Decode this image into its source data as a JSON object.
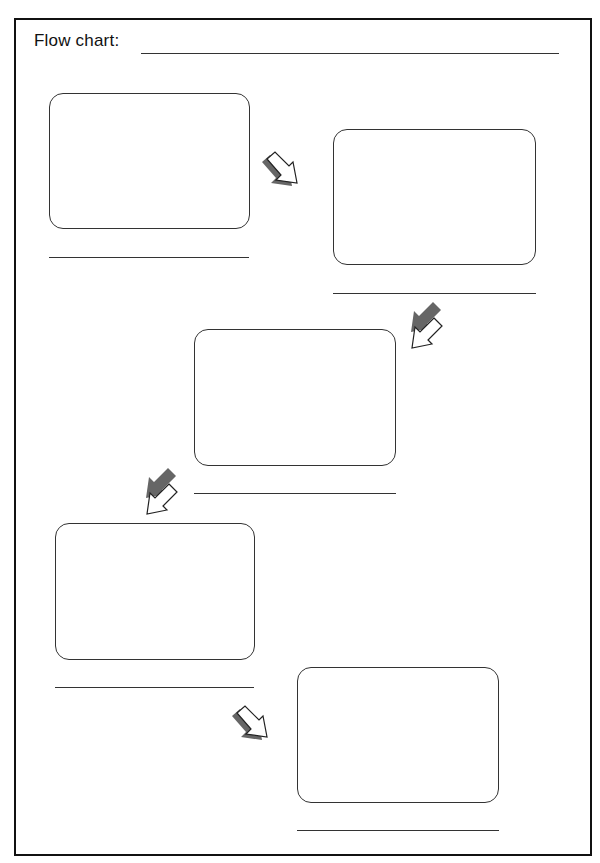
{
  "worksheet": {
    "title": "Flow chart:",
    "title_line": "",
    "steps": [
      {
        "box": "",
        "label": ""
      },
      {
        "box": "",
        "label": ""
      },
      {
        "box": "",
        "label": ""
      },
      {
        "box": "",
        "label": ""
      },
      {
        "box": "",
        "label": ""
      }
    ],
    "arrows": [
      {
        "direction": "down-right",
        "icon": "arrow-down-right-icon"
      },
      {
        "direction": "down-left",
        "icon": "arrow-down-left-icon"
      },
      {
        "direction": "down-left",
        "icon": "arrow-down-left-icon"
      },
      {
        "direction": "down-right",
        "icon": "arrow-down-right-icon"
      }
    ],
    "colors": {
      "stroke": "#333333",
      "arrow_shadow": "#666666",
      "background": "#ffffff"
    }
  }
}
